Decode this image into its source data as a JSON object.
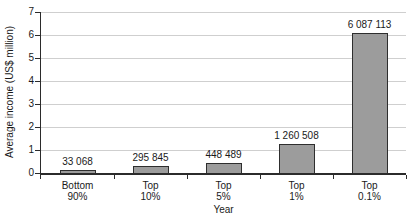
{
  "chart_data": {
    "type": "bar",
    "title": "",
    "xlabel": "Year",
    "ylabel": "Average income (US$ million)",
    "ylim": [
      0,
      7
    ],
    "yticks": [
      0,
      1,
      2,
      3,
      4,
      5,
      6,
      7
    ],
    "grid": "horizontal",
    "legend": "none",
    "categories": [
      "Bottom 90%",
      "Top 10%",
      "Top 5%",
      "Top 1%",
      "Top 0.1%"
    ],
    "category_lines": [
      [
        "Bottom",
        "90%"
      ],
      [
        "Top",
        "10%"
      ],
      [
        "Top",
        "5%"
      ],
      [
        "Top",
        "1%"
      ],
      [
        "Top",
        "0.1%"
      ]
    ],
    "values": [
      33068,
      295845,
      448489,
      1260508,
      6087113
    ],
    "value_labels": [
      "33 068",
      "295 845",
      "448 489",
      "1 260 508",
      "6 087 113"
    ]
  },
  "colors": {
    "bar_fill": "#9c9c9c",
    "bar_border": "#2e2e2e",
    "gridline": "#cfcfcf",
    "axis": "#2b2b2b",
    "text": "#1a1a1a",
    "background": "#ffffff"
  }
}
